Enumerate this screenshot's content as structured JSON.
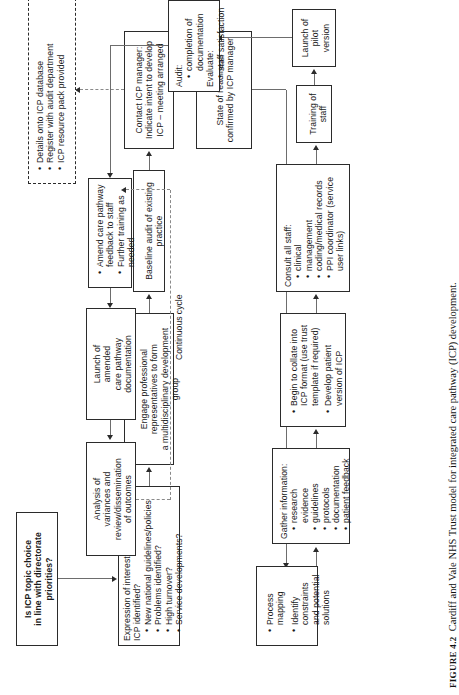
{
  "figure": {
    "label": "FIGURE 4.2",
    "caption": "Cardiff and Vale NHS Trust model for integrated care pathway (ICP) development."
  },
  "annotations": {
    "continuous_cycle": "Continuous cycle"
  },
  "nodes": {
    "topic_check": {
      "name": "is-icp-topic-choice-in-line",
      "line1": "Is ICP topic choice",
      "line2": "in line with directorate",
      "line3": "priorities?"
    },
    "expression_of_interest": {
      "heading": "Expression of interest: topic of new ICP identified?",
      "bullets": [
        "New national guidelines/policies",
        "Problems identified?",
        "High turnover?",
        "Service developments?"
      ]
    },
    "engage": {
      "line1": "Engage professional representatives to form",
      "line2": "a multidisciplinary development group"
    },
    "baseline_audit": {
      "text": "Baseline audit of existing practice"
    },
    "contact_icp_manager": {
      "line1": "Contact ICP manager:",
      "line2": "Indicate intent to develop",
      "line3": "ICP – meeting arranged"
    },
    "icp_database": {
      "bullets": [
        "Details onto ICP database",
        "Register with audit department",
        "ICP resource pack provided"
      ]
    },
    "state_of_readiness": {
      "text": "State of readiness confirmed by ICP manager"
    },
    "process_mapping": {
      "bullets": [
        "Process mapping",
        "Identify constraints and potential solutions"
      ]
    },
    "gather_information": {
      "heading": "Gather information:",
      "bullets": [
        "research evidence",
        "guidelines",
        "protocols",
        "documentation",
        "patient feedback"
      ]
    },
    "begin_to_collate": {
      "bullets": [
        "Begin to collate into ICP format (use trust template if required)",
        "Develop patient version of ICP"
      ]
    },
    "consult_all_staff": {
      "heading": "Consult all staff:",
      "bullets": [
        "clinical",
        "management",
        "coding/medical records",
        "PPI coordinator (service user links)"
      ]
    },
    "training_of_staff": {
      "text": "Training of staff"
    },
    "launch_pilot": {
      "line1": "Launch of",
      "line2": "pilot",
      "line3": "version"
    },
    "audit_evaluate": {
      "heading1": "Audit:",
      "bullet1": "completion of documentation",
      "heading2": "Evaluate:",
      "bullet2": "staff satisfaction"
    },
    "amend_care_pathway": {
      "bullets": [
        "Amend care pathway feedback to staff",
        "Further training as needed"
      ]
    },
    "launch_amended": {
      "line1": "Launch of",
      "line2": "amended",
      "line3": "care pathway",
      "line4": "documentation"
    },
    "analysis_variances": {
      "line1": "Analysis of",
      "line2": "variances and",
      "line3": "review/dissemination",
      "line4": "of outcomes"
    }
  }
}
